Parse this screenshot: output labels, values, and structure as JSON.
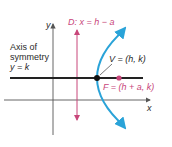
{
  "diagram": {
    "labels": {
      "directrix": "D: x = h − a",
      "vertex": "V = (h, k)",
      "focus": "F = (h + a, k)",
      "axis_line1": "Axis of",
      "axis_line2": "symmetry",
      "axis_line3": "y = k",
      "x_axis": "x",
      "y_axis": "y"
    },
    "colors": {
      "parabola": "#2aa3d8",
      "directrix": "#c8467a",
      "focus": "#c8467a",
      "axis": "#222222",
      "coord_axes": "#555555"
    },
    "points": {
      "vertex": {
        "x": 97,
        "y": 78
      },
      "focus": {
        "x": 119,
        "y": 78
      }
    }
  }
}
